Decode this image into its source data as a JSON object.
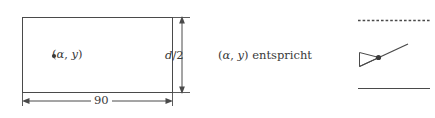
{
  "figure": {
    "name": "rectangle-to-wedge-correspondence-diagram",
    "stroke_color": "#4a4a4a",
    "text_color": "#3a3a3a",
    "background_color": "#ffffff",
    "width_px": 435,
    "height_px": 118
  },
  "rectangle": {
    "point_marker": "•",
    "point_label_open": "(",
    "point_label_alpha": "α",
    "point_label_comma": ", ",
    "point_label_y": "y",
    "point_label_close": ")",
    "point_label_full": "•(α, y)"
  },
  "dimensions": {
    "width_label": "90",
    "height_label_numerator": "d",
    "height_label_slash": "/",
    "height_label_denominator": "2",
    "height_label_full": "d/2"
  },
  "caption": {
    "open": "(",
    "alpha": "α",
    "comma": ", ",
    "y": "y",
    "close": ") ",
    "verb": "entspricht",
    "full": "(α, y) entspricht"
  },
  "wedge_diagram": {
    "top_line_style": "dashed",
    "bottom_line_style": "solid",
    "marked_point": "•",
    "description": "wedge with diagonal ray and marked point"
  }
}
